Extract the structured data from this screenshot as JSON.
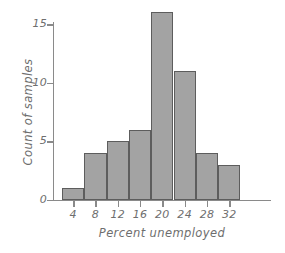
{
  "chart_data": {
    "type": "bar",
    "title": "",
    "subtitle": "",
    "xlabel": "Percent unemployed",
    "ylabel": "Count of samples",
    "categories": [
      "4",
      "8",
      "12",
      "16",
      "20",
      "24",
      "28",
      "32"
    ],
    "values": [
      1,
      4,
      5,
      6,
      16,
      11,
      4,
      3
    ],
    "series": [
      {
        "name": "Count of samples",
        "values": [
          1,
          4,
          5,
          6,
          16,
          11,
          4,
          3
        ]
      }
    ],
    "xtick_labels": [
      "4",
      "8",
      "12",
      "16",
      "20",
      "24",
      "28",
      "32"
    ],
    "ytick_labels": [
      "0",
      "5",
      "10",
      "15"
    ],
    "ytick_values": [
      0,
      5,
      10,
      15
    ],
    "ylim": [
      0,
      17
    ],
    "xlim": [
      2,
      34
    ],
    "bin_width": 4,
    "grid": false,
    "legend": "none",
    "bar_fill_color": "#a3a3a3",
    "bar_edge_color": "#5d5d5d",
    "axis_color": "#8a8a8a",
    "text_color": "#6e6e6e",
    "background_color": "#ffffff"
  }
}
